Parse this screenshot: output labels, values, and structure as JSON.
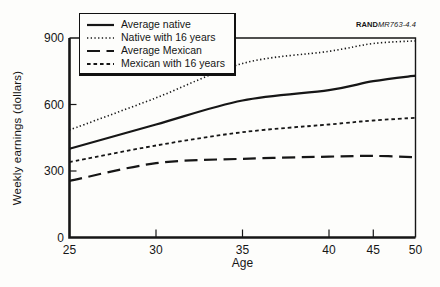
{
  "figure": {
    "source_label_bold": "RAND",
    "source_label_italic": "MR763-4.4",
    "ink_color": "#161616",
    "background_color": "#fdfdfb"
  },
  "chart_data": {
    "type": "line",
    "title": "",
    "xlabel": "Age",
    "ylabel": "Weekly earnings (dollars)",
    "x": [
      25,
      30,
      35,
      40,
      45,
      50
    ],
    "xticks": [
      25,
      30,
      35,
      40,
      45,
      50
    ],
    "x_tick_fractions": [
      0,
      0.25,
      0.5,
      0.75,
      0.878,
      1.0
    ],
    "yticks": [
      0,
      300,
      600,
      900
    ],
    "ylim": [
      0,
      900
    ],
    "grid": false,
    "legend_position": "top-left",
    "frame": "box",
    "series": [
      {
        "name": "Average native",
        "style": "solid",
        "values": [
          400,
          510,
          618,
          665,
          705,
          730
        ]
      },
      {
        "name": "Native with 16 years",
        "style": "dotted",
        "values": [
          485,
          630,
          785,
          840,
          875,
          887
        ]
      },
      {
        "name": "Average Mexican",
        "style": "long-dash",
        "values": [
          255,
          335,
          355,
          365,
          368,
          362
        ]
      },
      {
        "name": "Mexican with 16 years",
        "style": "short-dash",
        "values": [
          340,
          415,
          475,
          510,
          528,
          540
        ]
      }
    ]
  }
}
